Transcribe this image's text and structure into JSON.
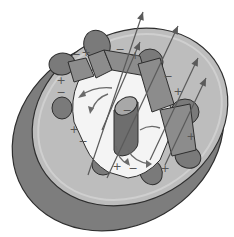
{
  "diagram": {
    "colors": {
      "background": "#ffffff",
      "disc_face": "#bdbdbd",
      "disc_side": "#7d7d7d",
      "outline": "#2e2e2e",
      "cavity_interior": "#f4f4f4",
      "lobe": "#7a7a7a",
      "vane": "#8c8c8c",
      "cathode": "#6e6e6e",
      "cathode_top": "#a8a8a8",
      "arrow": "#5a5a5a"
    },
    "charges": [
      {
        "sign": "+",
        "x": 86,
        "y": 56
      },
      {
        "sign": "−",
        "x": 76,
        "y": 58
      },
      {
        "sign": "−",
        "x": 120,
        "y": 53
      },
      {
        "sign": "+",
        "x": 135,
        "y": 59
      },
      {
        "sign": "+",
        "x": 61,
        "y": 84
      },
      {
        "sign": "−",
        "x": 61,
        "y": 96
      },
      {
        "sign": "−",
        "x": 168,
        "y": 80
      },
      {
        "sign": "+",
        "x": 178,
        "y": 95
      },
      {
        "sign": "−",
        "x": 127,
        "y": 114
      },
      {
        "sign": "+",
        "x": 74,
        "y": 133
      },
      {
        "sign": "−",
        "x": 83,
        "y": 145
      },
      {
        "sign": "+",
        "x": 191,
        "y": 140
      },
      {
        "sign": "+",
        "x": 117,
        "y": 170
      },
      {
        "sign": "−",
        "x": 133,
        "y": 172
      },
      {
        "sign": "+",
        "x": 165,
        "y": 172
      }
    ],
    "field_arrows": [
      {
        "x1": 88,
        "y1": 175,
        "x2": 143,
        "y2": 12
      },
      {
        "x1": 107,
        "y1": 178,
        "x2": 178,
        "y2": 26
      },
      {
        "x1": 102,
        "y1": 130,
        "x2": 140,
        "y2": 42
      },
      {
        "x1": 150,
        "y1": 160,
        "x2": 198,
        "y2": 58
      },
      {
        "x1": 165,
        "y1": 165,
        "x2": 206,
        "y2": 78
      }
    ]
  }
}
